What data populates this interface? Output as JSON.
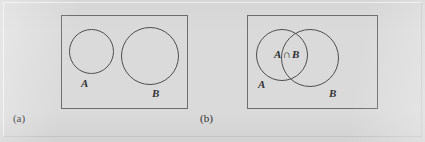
{
  "figure": {
    "kind": "venn-diagram-figure",
    "background_color": "#dadada",
    "frame_color": "#6d6d6d",
    "stroke_color": "#4f4f4f",
    "text_color": "#2e2e2e"
  },
  "panels": [
    {
      "id": "a",
      "caption": "(a)",
      "description": "two disjoint sets",
      "rect": {
        "x": 61,
        "y": 15,
        "width": 127,
        "height": 94
      },
      "circles": [
        {
          "name": "A",
          "label": "A",
          "cx": 91,
          "cy": 51,
          "r": 22
        },
        {
          "name": "B",
          "label": "B",
          "cx": 150,
          "cy": 56,
          "r": 29
        }
      ],
      "labels": [
        {
          "name": "set-a-label",
          "text": "A"
        },
        {
          "name": "set-b-label",
          "text": "B"
        }
      ]
    },
    {
      "id": "b",
      "caption": "(b)",
      "description": "two overlapping sets with intersection",
      "rect": {
        "x": 247,
        "y": 15,
        "width": 131,
        "height": 94
      },
      "circles": [
        {
          "name": "A",
          "label": "A",
          "cx": 282,
          "cy": 55,
          "r": 26
        },
        {
          "name": "B",
          "label": "B",
          "cx": 310,
          "cy": 58,
          "r": 29
        }
      ],
      "labels": [
        {
          "name": "set-a-label",
          "text": "A"
        },
        {
          "name": "set-b-label",
          "text": "B"
        },
        {
          "name": "intersection-label",
          "text": "A ∩ B"
        }
      ],
      "intersection": {
        "symbol": "∩",
        "left_operand": "A",
        "right_operand": "B",
        "text": "A ∩ B"
      }
    }
  ]
}
